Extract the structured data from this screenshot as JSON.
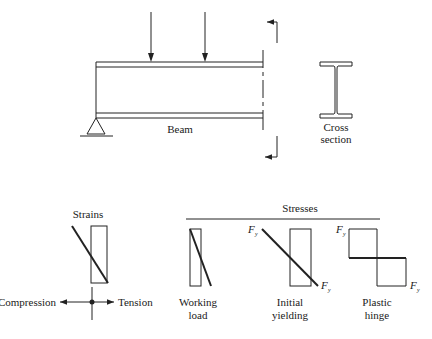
{
  "beam": {
    "label": "Beam",
    "load_arrows": 2,
    "support": "pin-support-icon"
  },
  "cross_section": {
    "label_line1": "Cross",
    "label_line2": "section",
    "shape": "i-beam"
  },
  "strains": {
    "title": "Strains",
    "axis_left_label": "Compression",
    "axis_right_label": "Tension"
  },
  "stresses": {
    "title": "Stresses",
    "diagrams": [
      {
        "label_line1": "Working",
        "label_line2": "load"
      },
      {
        "label_line1": "Initial",
        "label_line2": "yielding",
        "top_label": "F",
        "top_sub": "y",
        "bottom_label": "F",
        "bottom_sub": "y"
      },
      {
        "label_line1": "Plastic",
        "label_line2": "hinge",
        "top_label": "F",
        "top_sub": "y",
        "bottom_label": "F",
        "bottom_sub": "y"
      }
    ]
  },
  "colors": {
    "line": "#222222",
    "background": "#ffffff"
  }
}
